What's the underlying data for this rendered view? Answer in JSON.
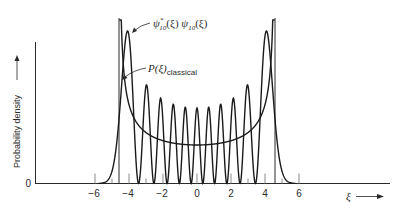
{
  "chart_data": {
    "type": "line",
    "title": "",
    "xlabel": "ξ",
    "ylabel": "Probability density",
    "xlim": [
      -8.3,
      11.3
    ],
    "ylim": [
      0,
      1
    ],
    "x_ticks": [
      -6,
      -4,
      -2,
      0,
      2,
      4,
      6
    ],
    "x_tick_labels": [
      "−6",
      "−4",
      "−2",
      "0",
      "2",
      "4",
      "6"
    ],
    "y_ticks": [
      0
    ],
    "y_tick_labels": [
      "0"
    ],
    "grid": false,
    "legend": null,
    "classical_turning_points": [
      -4.58,
      4.58
    ],
    "series": [
      {
        "name": "ψ*10(ξ) ψ10(ξ)",
        "kind": "quantum probability density, n = 10",
        "peak_count": 11,
        "peak_positions_xi": [
          -4.1,
          -3.1,
          -2.3,
          -1.5,
          -0.75,
          0,
          0.75,
          1.5,
          2.3,
          3.1,
          4.1
        ],
        "peak_relative_heights": [
          1.0,
          0.64,
          0.56,
          0.52,
          0.5,
          0.5,
          0.5,
          0.52,
          0.56,
          0.64,
          1.0
        ]
      },
      {
        "name": "P(ξ)classical",
        "kind": "classical probability density",
        "formula": "1 / (π √(21 − ξ²))",
        "minimum_at_xi": 0,
        "minimum_relative_height": 0.25
      }
    ],
    "annotations": [
      {
        "text": "ψ*10(ξ) ψ10(ξ)",
        "points_to": "outer peak near ξ = −4"
      },
      {
        "text": "P(ξ)classical",
        "points_to": "classical curve near ξ = −4.4"
      }
    ]
  },
  "labels": {
    "y_axis": "Probability density",
    "y_zero": "0",
    "x_axis": "ξ",
    "psi_main": "ψ",
    "psi_sup": "*",
    "psi_sub": "10",
    "psi_arg": "(ξ)",
    "psi2_main": " ψ",
    "psi2_sub": "10",
    "psi2_arg": "(ξ)",
    "p_main": "P(ξ)",
    "p_sub": "classical",
    "ticks": [
      "−6",
      "−4",
      "−2",
      "0",
      "2",
      "4",
      "6"
    ]
  }
}
